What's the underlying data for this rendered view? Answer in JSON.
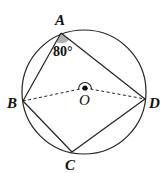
{
  "diagram": {
    "circle": {
      "cx": 84,
      "cy": 92,
      "r": 62,
      "center_label": "O"
    },
    "points": {
      "A": {
        "label": "A",
        "x": 61,
        "y": 33
      },
      "B": {
        "label": "B",
        "x": 23,
        "y": 101
      },
      "C": {
        "label": "C",
        "x": 72,
        "y": 152
      },
      "D": {
        "label": "D",
        "x": 145,
        "y": 99
      },
      "O": {
        "label": "O",
        "x": 85,
        "y": 88
      }
    },
    "angle_A": {
      "label": "80°",
      "value": 80
    },
    "segments_solid": [
      "AB",
      "AD",
      "BC",
      "CD"
    ],
    "segments_dashed": [
      "OB",
      "OD"
    ],
    "colors": {
      "stroke": "#222222",
      "angle_fill": "#b0b0b0"
    }
  }
}
